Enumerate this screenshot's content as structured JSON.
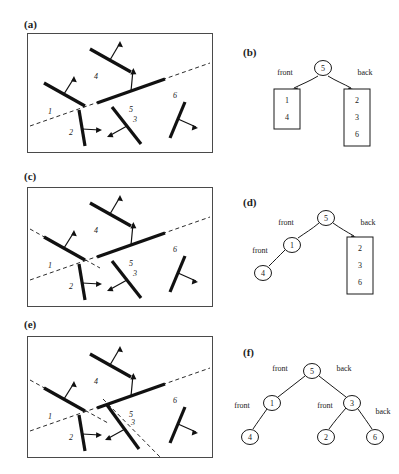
{
  "figure": {
    "panels": [
      {
        "key": "a",
        "label": "(a)",
        "type": "scene"
      },
      {
        "key": "b",
        "label": "(b)",
        "type": "tree"
      },
      {
        "key": "c",
        "label": "(c)",
        "type": "scene"
      },
      {
        "key": "d",
        "label": "(d)",
        "type": "tree"
      },
      {
        "key": "e",
        "label": "(e)",
        "type": "scene"
      },
      {
        "key": "f",
        "label": "(f)",
        "type": "tree"
      }
    ]
  },
  "labels": {
    "front": "front",
    "back": "back"
  },
  "segments": {
    "s1": "1",
    "s2": "2",
    "s3": "3",
    "s4": "4",
    "s5": "5",
    "s6": "6"
  },
  "scene_a": {
    "caption": "(a)",
    "segment_labels": [
      "1",
      "2",
      "3",
      "4",
      "5",
      "6"
    ],
    "splitting_lines": 1
  },
  "scene_c": {
    "caption": "(c)",
    "segment_labels": [
      "1",
      "2",
      "3",
      "4",
      "5",
      "6"
    ],
    "splitting_lines": 2
  },
  "scene_e": {
    "caption": "(e)",
    "segment_labels": [
      "1",
      "2",
      "3",
      "4",
      "5",
      "6"
    ],
    "splitting_lines": 3
  },
  "tree_b": {
    "caption": "(b)",
    "root": "5",
    "front_label": "front",
    "back_label": "back",
    "front_list": [
      "1",
      "4"
    ],
    "back_list": [
      "2",
      "3",
      "6"
    ]
  },
  "tree_d": {
    "caption": "(d)",
    "root": "5",
    "front_label": "front",
    "back_label": "back",
    "child_front": "1",
    "child_front_front_label": "front",
    "child_front_front": "4",
    "back_list": [
      "2",
      "3",
      "6"
    ]
  },
  "tree_f": {
    "caption": "(f)",
    "root": "5",
    "front_label": "front",
    "back_label": "back",
    "node_1": "1",
    "node_3": "3",
    "node_4": "4",
    "node_2": "2",
    "node_6": "6",
    "edge_1_front": "front",
    "edge_3_front": "front",
    "edge_3_back": "back"
  },
  "colors": {
    "ink": "#1a1a1a",
    "frame": "#4a4a4a",
    "segment": "#111111",
    "dashed": "#333333",
    "background": "#ffffff"
  }
}
